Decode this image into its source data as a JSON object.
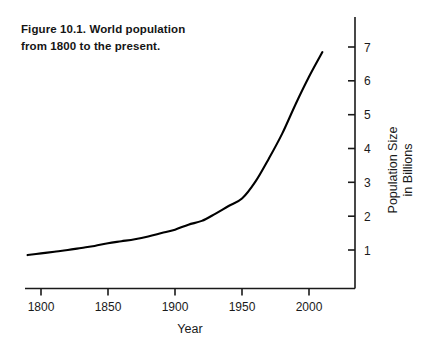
{
  "figure": {
    "caption_line1": "Figure 10.1. World population",
    "caption_line2": "from 1800 to the present."
  },
  "chart_data": {
    "type": "line",
    "title": "Figure 10.1. World population from 1800 to the present.",
    "xlabel": "Year",
    "ylabel": "Population Size in Billions",
    "ylabel_line1": "Population Size",
    "ylabel_line2": "in Billions",
    "xlim": [
      1790,
      2010
    ],
    "ylim": [
      0,
      7.6
    ],
    "grid": false,
    "legend": false,
    "x_ticks": [
      1800,
      1850,
      1900,
      1950,
      2000
    ],
    "x_tick_labels": [
      "1800",
      "1850",
      "1900",
      "1950",
      "2000"
    ],
    "y_ticks": [
      1,
      2,
      3,
      4,
      5,
      6,
      7
    ],
    "y_tick_labels": [
      "1",
      "2",
      "3",
      "4",
      "5",
      "6",
      "7"
    ],
    "y_axis_position": "right",
    "x": [
      1790,
      1800,
      1810,
      1820,
      1830,
      1840,
      1850,
      1860,
      1870,
      1880,
      1890,
      1900,
      1910,
      1920,
      1930,
      1940,
      1950,
      1960,
      1970,
      1980,
      1990,
      2000,
      2010
    ],
    "values": [
      0.85,
      0.9,
      0.95,
      1.0,
      1.06,
      1.12,
      1.2,
      1.26,
      1.32,
      1.4,
      1.5,
      1.6,
      1.75,
      1.86,
      2.07,
      2.3,
      2.52,
      3.02,
      3.7,
      4.44,
      5.31,
      6.12,
      6.85
    ],
    "series": [
      {
        "name": "World population",
        "color": "#000000",
        "values": [
          0.85,
          0.9,
          0.95,
          1.0,
          1.06,
          1.12,
          1.2,
          1.26,
          1.32,
          1.4,
          1.5,
          1.6,
          1.75,
          1.86,
          2.07,
          2.3,
          2.52,
          3.02,
          3.7,
          4.44,
          5.31,
          6.12,
          6.85
        ]
      }
    ],
    "units": "billions",
    "axis_color": "#1a1a1a"
  }
}
